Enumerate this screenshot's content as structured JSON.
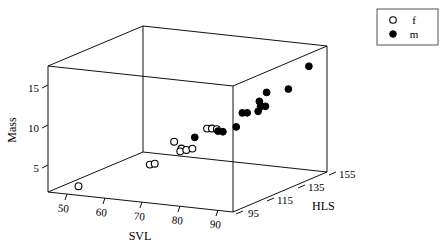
{
  "chart_data": {
    "type": "scatter",
    "title": "",
    "projection": "3d",
    "xlabel": "SVL",
    "ylabel": "Mass",
    "zlabel": "HLS",
    "xticks": [
      50,
      60,
      70,
      80,
      90
    ],
    "yticks": [
      5,
      10,
      15
    ],
    "zticks": [
      95,
      115,
      135,
      155
    ],
    "xlim": [
      45,
      95
    ],
    "ylim": [
      2,
      18
    ],
    "zlim": [
      85,
      165
    ],
    "grid": false,
    "legend_position": "top-right",
    "series": [
      {
        "name": "f",
        "marker": "open-circle",
        "color": "#ffffff",
        "edge_color": "#000000",
        "points": [
          {
            "svl": 51,
            "mass": 2.6,
            "hls": 92
          },
          {
            "svl": 69,
            "mass": 6.0,
            "hls": 96
          },
          {
            "svl": 70,
            "mass": 6.1,
            "hls": 97
          },
          {
            "svl": 73,
            "mass": 8.6,
            "hls": 104
          },
          {
            "svl": 74,
            "mass": 7.6,
            "hls": 107
          },
          {
            "svl": 74,
            "mass": 7.3,
            "hls": 106
          },
          {
            "svl": 75,
            "mass": 7.4,
            "hls": 108
          },
          {
            "svl": 76,
            "mass": 7.5,
            "hls": 110
          },
          {
            "svl": 79,
            "mass": 10.0,
            "hls": 113
          },
          {
            "svl": 80,
            "mass": 10.0,
            "hls": 114
          },
          {
            "svl": 81,
            "mass": 9.9,
            "hls": 115
          }
        ]
      },
      {
        "name": "m",
        "marker": "filled-circle",
        "color": "#000000",
        "edge_color": "#000000",
        "points": [
          {
            "svl": 76,
            "mass": 8.8,
            "hls": 112
          },
          {
            "svl": 81,
            "mass": 9.6,
            "hls": 116
          },
          {
            "svl": 82,
            "mass": 9.5,
            "hls": 117
          },
          {
            "svl": 84,
            "mass": 9.9,
            "hls": 122
          },
          {
            "svl": 85,
            "mass": 11.6,
            "hls": 124
          },
          {
            "svl": 86,
            "mass": 11.6,
            "hls": 125
          },
          {
            "svl": 88,
            "mass": 11.7,
            "hls": 128
          },
          {
            "svl": 88,
            "mass": 12.2,
            "hls": 130
          },
          {
            "svl": 89,
            "mass": 12.2,
            "hls": 131
          },
          {
            "svl": 88,
            "mass": 12.9,
            "hls": 129
          },
          {
            "svl": 89,
            "mass": 13.9,
            "hls": 132
          },
          {
            "svl": 92,
            "mass": 13.9,
            "hls": 141
          },
          {
            "svl": 94,
            "mass": 16.2,
            "hls": 152
          }
        ]
      }
    ]
  },
  "legend": {
    "entries": [
      {
        "label": "f",
        "marker": "open-circle"
      },
      {
        "label": "m",
        "marker": "filled-circle"
      }
    ]
  },
  "axes": {
    "y_title": "Mass",
    "x_title": "SVL",
    "z_title": "HLS",
    "y_tick_labels": [
      "15",
      "10",
      "5"
    ],
    "x_tick_labels": [
      "50",
      "60",
      "70",
      "80",
      "90"
    ],
    "z_tick_labels": [
      "95",
      "115",
      "135",
      "155"
    ]
  },
  "colors": {
    "line": "#111111",
    "female_fill": "#ffffff",
    "male_fill": "#000000",
    "background": "#ffffff"
  }
}
